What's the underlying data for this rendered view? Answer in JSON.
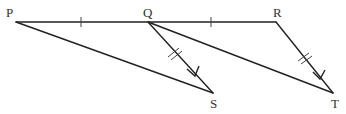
{
  "diagram": {
    "points": {
      "P": {
        "label": "P",
        "x": 16,
        "y": 22
      },
      "Q": {
        "label": "Q",
        "x": 148,
        "y": 22
      },
      "R": {
        "label": "R",
        "x": 276,
        "y": 22
      },
      "S": {
        "label": "S",
        "x": 213,
        "y": 93
      },
      "T": {
        "label": "T",
        "x": 333,
        "y": 93
      }
    },
    "segments": [
      "PR",
      "PS",
      "QS",
      "QT",
      "RT"
    ],
    "equal_marks": {
      "single_tick": [
        "PQ",
        "QR"
      ],
      "double_tick": [
        "QS",
        "RT"
      ]
    },
    "arrows": [
      "QS",
      "RT"
    ],
    "colors": {
      "line": "#222222",
      "label": "#333333",
      "background": "#ffffff"
    }
  }
}
